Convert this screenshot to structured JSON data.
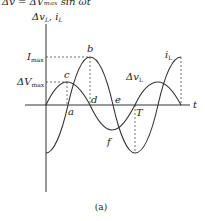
{
  "header": {
    "equation": "Δv = ΔVₘₐₓ sin ωt"
  },
  "axes": {
    "y_label": "Δv_L, i_L",
    "y_label_main": "Δv",
    "y_label_sub": "L",
    "y_label_rest": ", i",
    "y_label_sub2": "L",
    "x_label": "t",
    "imax_label": "I",
    "imax_sub": "max",
    "vmax_label": "ΔV",
    "vmax_sub": "max"
  },
  "points": {
    "a": "a",
    "b": "b",
    "c": "c",
    "d": "d",
    "e": "e",
    "f": "f",
    "T": "T"
  },
  "curves": {
    "voltage_label": "Δv",
    "voltage_sub": "L",
    "current_label": "i",
    "current_sub": "L"
  },
  "caption": "(a)"
}
